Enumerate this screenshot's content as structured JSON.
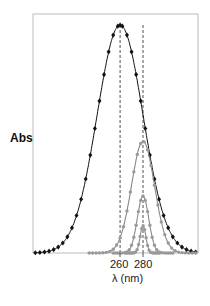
{
  "chart_data": {
    "type": "line",
    "title": "",
    "xlabel": "λ (nm)",
    "ylabel": "Abs",
    "xticks": [
      260,
      280
    ],
    "xlim": [
      184,
      328
    ],
    "ylim": [
      0,
      1
    ],
    "grid": false,
    "legend": null,
    "annotations": [
      {
        "type": "vertical-dashed-line",
        "x": 260
      },
      {
        "type": "vertical-dashed-line",
        "x": 280
      }
    ],
    "series": [
      {
        "name": "black-broad",
        "color": "#111111",
        "marker": "diamond",
        "center": 260,
        "sigma": 20,
        "peak": 1.0,
        "x": [
          186,
          190,
          194,
          198,
          202,
          206,
          210,
          214,
          218,
          222,
          226,
          230,
          234,
          238,
          242,
          246,
          250,
          254,
          258,
          260,
          262,
          266,
          270,
          274,
          278,
          282,
          286,
          290,
          294,
          298,
          302,
          306,
          310,
          314,
          318,
          322,
          326
        ]
      },
      {
        "name": "gray-large",
        "color": "#888888",
        "marker": "circle",
        "center": 280,
        "sigma": 10,
        "peak": 0.49
      },
      {
        "name": "gray-medium",
        "color": "#888888",
        "marker": "circle",
        "center": 280,
        "sigma": 5,
        "peak": 0.25
      },
      {
        "name": "gray-small",
        "color": "#888888",
        "marker": "circle",
        "center": 280,
        "sigma": 2.5,
        "peak": 0.12
      }
    ]
  },
  "labels": {
    "ylabel": "Abs",
    "tick_260": "260",
    "tick_280": "280",
    "xlabel": "λ (nm)"
  }
}
